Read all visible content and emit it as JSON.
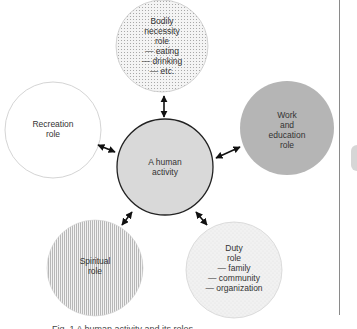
{
  "diagram": {
    "center": {
      "label": "A human\nactivity",
      "fill": "#d9d9d9",
      "stroke": "#222222"
    },
    "roles": [
      {
        "id": "bodily",
        "label": "Bodily\nnecessity\nrole\n— eating\n— drinking\n— etc.",
        "pattern": "dotted",
        "fill": "#ececec"
      },
      {
        "id": "work",
        "label": "Work\nand\neducation\nrole",
        "pattern": "solid",
        "fill": "#b5b5b5"
      },
      {
        "id": "duty",
        "label": "Duty\nrole\n— family\n— community\n— organization",
        "pattern": "stipple",
        "fill": "#eeeeee"
      },
      {
        "id": "spiritual",
        "label": "Spiritual\nrole",
        "pattern": "vertical-lines",
        "fill": "#e6e6e6"
      },
      {
        "id": "recreation",
        "label": "Recreation\nrole",
        "pattern": "none",
        "fill": "#ffffff"
      }
    ],
    "connector": "double-headed-arrow",
    "caption": "Fig. 1  A human activity and its roles"
  }
}
